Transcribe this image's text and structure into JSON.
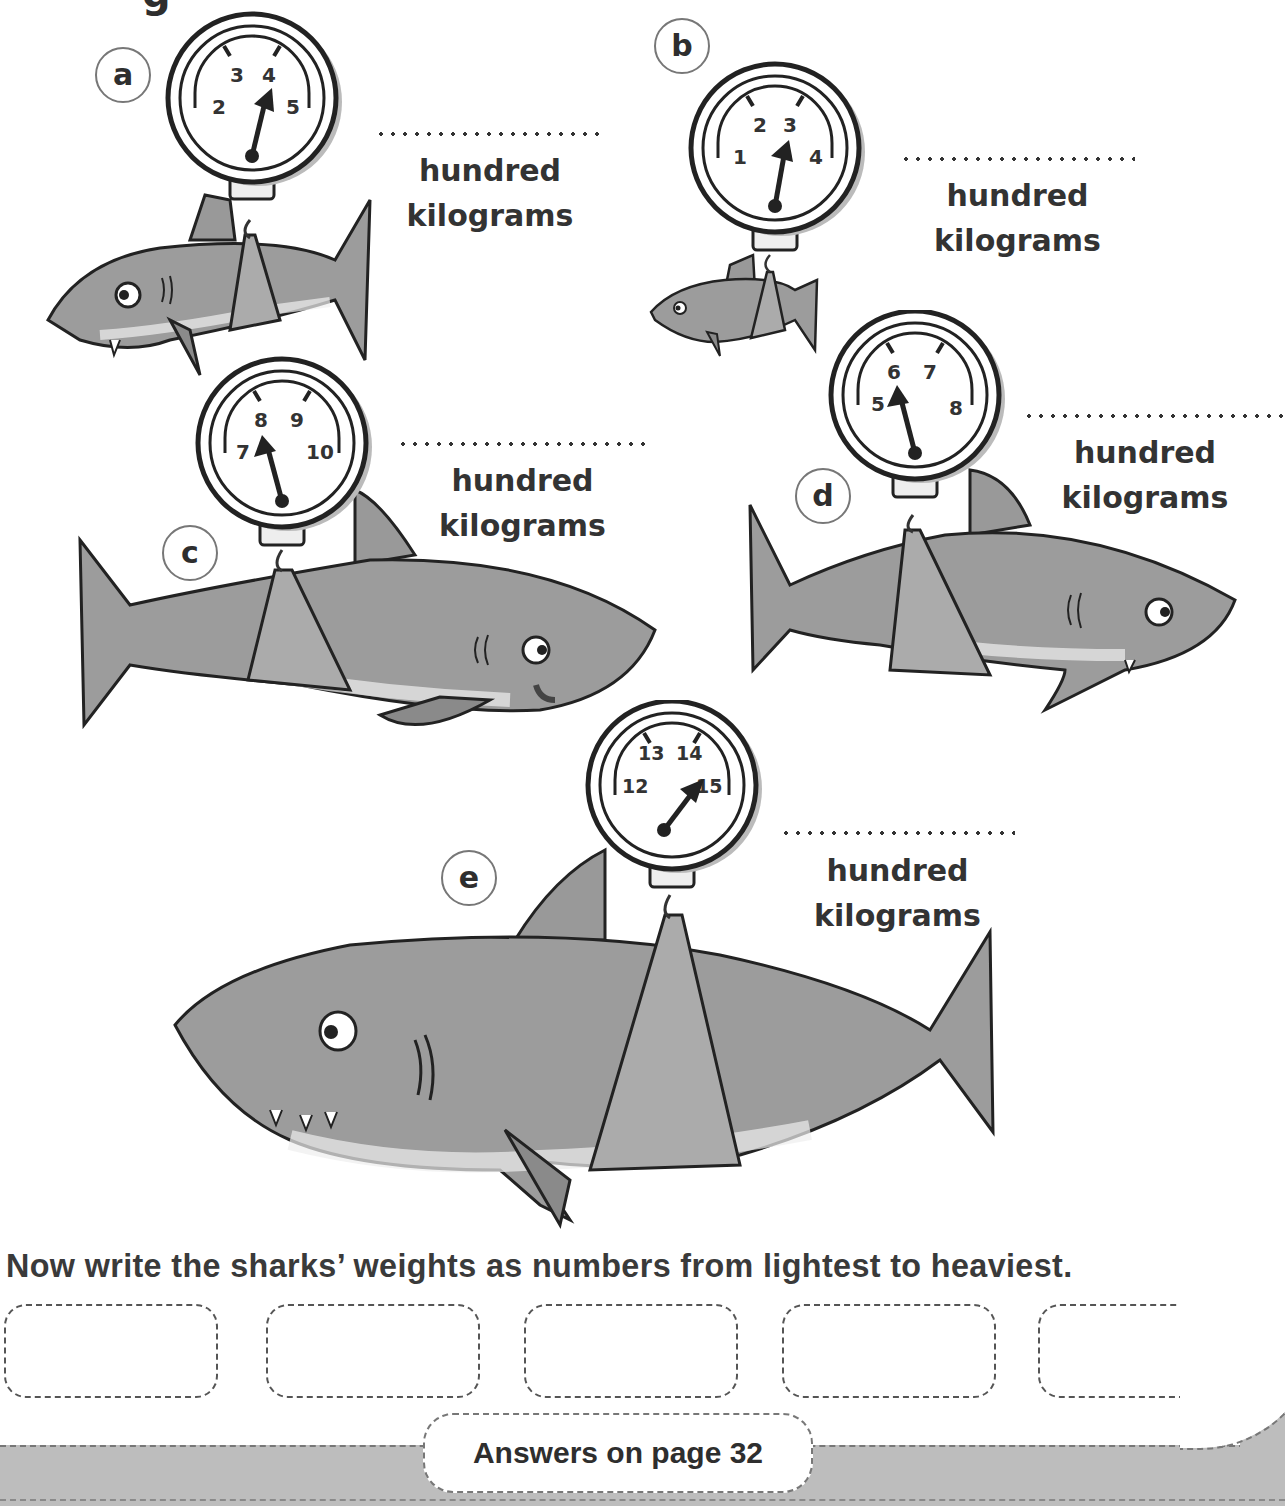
{
  "page": {
    "header_fragment": "g",
    "unit_line1": "hundred",
    "unit_line2": "kilograms"
  },
  "items": [
    {
      "letter": "a",
      "scale": {
        "labels": [
          "2",
          "3",
          "4",
          "5"
        ],
        "reading": 4
      },
      "answer_value": ""
    },
    {
      "letter": "b",
      "scale": {
        "labels": [
          "1",
          "2",
          "3",
          "4"
        ],
        "reading": 3
      },
      "answer_value": ""
    },
    {
      "letter": "c",
      "scale": {
        "labels": [
          "7",
          "8",
          "9",
          "10"
        ],
        "reading": 8
      },
      "answer_value": ""
    },
    {
      "letter": "d",
      "scale": {
        "labels": [
          "5",
          "6",
          "7",
          "8"
        ],
        "reading": 6
      },
      "answer_value": ""
    },
    {
      "letter": "e",
      "scale": {
        "labels": [
          "12",
          "13",
          "14",
          "15"
        ],
        "reading": 15
      },
      "answer_value": ""
    }
  ],
  "ordering": {
    "instruction": "Now write the sharks’ weights as numbers from lightest to heaviest.",
    "boxes": [
      "",
      "",
      "",
      "",
      ""
    ]
  },
  "footer": {
    "answers_note": "Answers on page 32"
  },
  "colors": {
    "ink": "#2e2e2e",
    "shark_body": "#9a9a9a",
    "shark_belly": "#e6e6e6",
    "sling": "#a8a8a8",
    "footer_band": "#bdbdbd"
  }
}
